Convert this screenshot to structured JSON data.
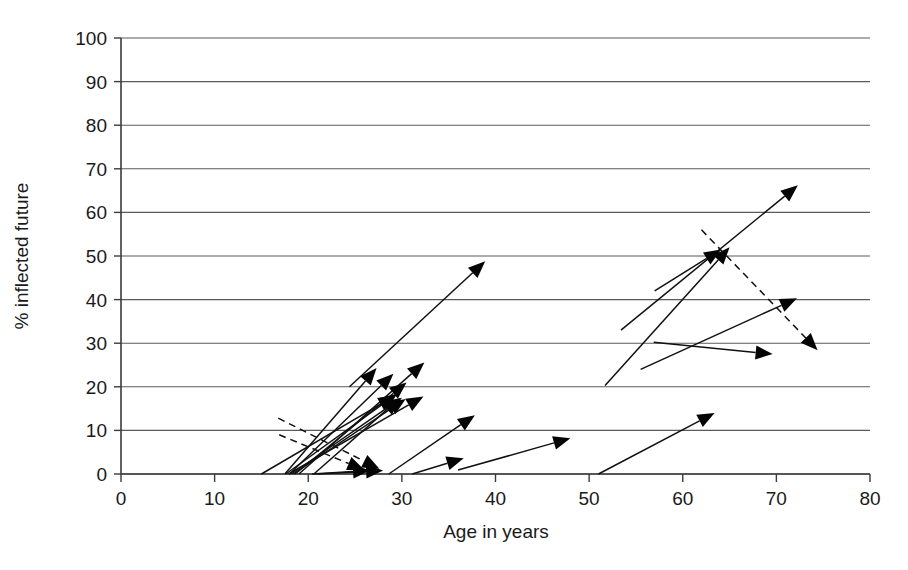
{
  "chart_data": {
    "type": "scatter",
    "title": "",
    "xlabel": "Age in years",
    "ylabel": "% inflected future",
    "xlim": [
      0,
      80
    ],
    "ylim": [
      0,
      100
    ],
    "xticks": [
      0,
      10,
      20,
      30,
      40,
      50,
      60,
      70,
      80
    ],
    "xtick_labels": [
      "0",
      "10",
      "20",
      "30",
      "40",
      "50",
      "60",
      "70",
      "80"
    ],
    "yticks": [
      0,
      10,
      20,
      30,
      40,
      50,
      60,
      70,
      80,
      90,
      100
    ],
    "ytick_labels": [
      "0",
      "10",
      "20",
      "30",
      "40",
      "50",
      "60",
      "70",
      "80",
      "90",
      "100"
    ],
    "grid": "horizontal",
    "legend": "none",
    "marker": "arrow",
    "arrows": [
      {
        "id": "a01",
        "style": "solid",
        "x0": 24.4,
        "y0": 20.0,
        "x1": 38.9,
        "y1": 48.8
      },
      {
        "id": "a02",
        "style": "solid",
        "x0": 17.5,
        "y0": 0.0,
        "x1": 27.3,
        "y1": 24.3
      },
      {
        "id": "a03",
        "style": "solid",
        "x0": 18.0,
        "y0": 0.0,
        "x1": 29.1,
        "y1": 23.0
      },
      {
        "id": "a04",
        "style": "solid",
        "x0": 19.0,
        "y0": 0.0,
        "x1": 32.4,
        "y1": 25.6
      },
      {
        "id": "a05",
        "style": "solid",
        "x0": 18.6,
        "y0": 0.0,
        "x1": 30.5,
        "y1": 21.0
      },
      {
        "id": "a06",
        "style": "solid",
        "x0": 18.2,
        "y0": 0.0,
        "x1": 30.0,
        "y1": 17.5
      },
      {
        "id": "a07",
        "style": "solid",
        "x0": 18.4,
        "y0": 0.0,
        "x1": 30.4,
        "y1": 17.2
      },
      {
        "id": "a08",
        "style": "solid",
        "x0": 17.9,
        "y0": 0.0,
        "x1": 32.3,
        "y1": 17.8
      },
      {
        "id": "a09",
        "style": "solid",
        "x0": 17.6,
        "y0": 0.0,
        "x1": 29.5,
        "y1": 18.4
      },
      {
        "id": "a10",
        "style": "solid",
        "x0": 15.0,
        "y0": 0.0,
        "x1": 29.3,
        "y1": 18.0
      },
      {
        "id": "a11",
        "style": "solid",
        "x0": 20.6,
        "y0": 0.0,
        "x1": 29.8,
        "y1": 17.4
      },
      {
        "id": "a12",
        "style": "solid",
        "x0": 21.0,
        "y0": 0.0,
        "x1": 28.0,
        "y1": 0.8
      },
      {
        "id": "a13",
        "style": "solid",
        "x0": 20.4,
        "y0": 0.0,
        "x1": 26.6,
        "y1": 0.8
      },
      {
        "id": "a14",
        "style": "dashed",
        "x0": 16.8,
        "y0": 12.8,
        "x1": 27.6,
        "y1": 1.2
      },
      {
        "id": "a15",
        "style": "dashed",
        "x0": 16.9,
        "y0": 9.0,
        "x1": 26.0,
        "y1": 0.9
      },
      {
        "id": "a16",
        "style": "solid",
        "x0": 28.6,
        "y0": 0.0,
        "x1": 37.8,
        "y1": 13.5
      },
      {
        "id": "a17",
        "style": "solid",
        "x0": 31.1,
        "y0": 0.0,
        "x1": 36.6,
        "y1": 3.6
      },
      {
        "id": "a18",
        "style": "solid",
        "x0": 36.0,
        "y0": 0.9,
        "x1": 48.0,
        "y1": 8.2
      },
      {
        "id": "a19",
        "style": "solid",
        "x0": 51.0,
        "y0": 0.0,
        "x1": 63.4,
        "y1": 14.0
      },
      {
        "id": "a20",
        "style": "solid",
        "x0": 53.4,
        "y0": 33.0,
        "x1": 72.3,
        "y1": 66.2
      },
      {
        "id": "a21",
        "style": "solid",
        "x0": 57.0,
        "y0": 42.0,
        "x1": 64.1,
        "y1": 51.5
      },
      {
        "id": "a22",
        "style": "solid",
        "x0": 51.7,
        "y0": 20.3,
        "x1": 65.0,
        "y1": 52.0
      },
      {
        "id": "a23",
        "style": "solid",
        "x0": 56.9,
        "y0": 30.2,
        "x1": 69.6,
        "y1": 27.5
      },
      {
        "id": "a24",
        "style": "solid",
        "x0": 55.5,
        "y0": 24.0,
        "x1": 72.2,
        "y1": 40.3
      },
      {
        "id": "a25",
        "style": "dashed",
        "x0": 62.0,
        "y0": 56.0,
        "x1": 74.4,
        "y1": 28.4
      }
    ]
  },
  "figure": {
    "background_color": "#ffffff",
    "line_color": "#111111",
    "grid_color": "#5a5a5a"
  }
}
